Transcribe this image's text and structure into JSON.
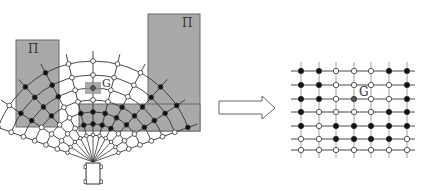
{
  "colors": {
    "background": "#ffffff",
    "obstacle_fill": "#a9a9a9",
    "obstacle_stroke": "#6b6b6b",
    "goal_box": "#8e8e8e",
    "line": "#333333",
    "node_occupied": "#111111",
    "node_free": "#ffffff",
    "node_goal": "#555555"
  },
  "left_panel": {
    "obstacles": [
      {
        "label": "Π",
        "x": 16,
        "y": 40,
        "w": 43,
        "h": 87
      },
      {
        "label": "Π",
        "x": 148,
        "y": 14,
        "w": 52,
        "h": 117
      }
    ],
    "inner_obstacle": {
      "x": 79,
      "y": 104,
      "w": 121,
      "h": 27
    },
    "goal_label": "G",
    "vehicle": "car-top-view"
  },
  "arrow": {
    "direction": "right"
  },
  "right_panel": {
    "goal_label": "G",
    "grid": {
      "cols": 7,
      "rows": 7,
      "states": [
        [
          "B",
          "B",
          "W",
          "W",
          "W",
          "B",
          "B"
        ],
        [
          "B",
          "B",
          "W",
          "W",
          "W",
          "W",
          "B"
        ],
        [
          "B",
          "B",
          "W",
          "G",
          "W",
          "W",
          "B"
        ],
        [
          "B",
          "W",
          "W",
          "W",
          "W",
          "B",
          "B"
        ],
        [
          "B",
          "W",
          "B",
          "B",
          "B",
          "B",
          "B"
        ],
        [
          "W",
          "W",
          "B",
          "B",
          "B",
          "B",
          "W"
        ],
        [
          "W",
          "W",
          "W",
          "W",
          "W",
          "W",
          "W"
        ]
      ]
    }
  }
}
